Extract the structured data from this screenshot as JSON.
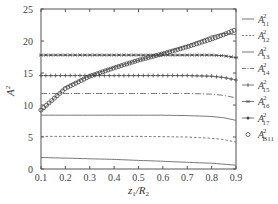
{
  "chart_data": {
    "type": "line",
    "title": "",
    "xlabel": "z1/R2",
    "ylabel": "A^2",
    "xlim": [
      0.1,
      0.9
    ],
    "ylim": [
      0,
      25
    ],
    "xticks": [
      0.1,
      0.2,
      0.3,
      0.4,
      0.5,
      0.6,
      0.7,
      0.8,
      0.9
    ],
    "yticks": [
      0,
      5,
      10,
      15,
      20,
      25
    ],
    "grid": false,
    "legend_position": "right-outside",
    "x": [
      0.1,
      0.2,
      0.3,
      0.4,
      0.5,
      0.6,
      0.7,
      0.8,
      0.85,
      0.9
    ],
    "series": [
      {
        "name": "A^2_11",
        "style": "solid",
        "values": [
          1.8,
          1.7,
          1.6,
          1.5,
          1.35,
          1.2,
          1.05,
          0.9,
          0.75,
          0.6
        ]
      },
      {
        "name": "A^2_12",
        "style": "dashed",
        "values": [
          5.1,
          5.1,
          5.1,
          5.1,
          5.1,
          5.05,
          5.0,
          4.8,
          4.6,
          4.2
        ]
      },
      {
        "name": "A^2_13",
        "style": "solid",
        "values": [
          8.4,
          8.4,
          8.4,
          8.4,
          8.4,
          8.4,
          8.35,
          8.2,
          8.0,
          7.6
        ]
      },
      {
        "name": "A^2_14",
        "style": "dash-dot",
        "values": [
          11.8,
          11.8,
          11.8,
          11.8,
          11.8,
          11.8,
          11.8,
          11.7,
          11.5,
          11.1
        ]
      },
      {
        "name": "A^2_15",
        "style": "plus-marker",
        "values": [
          14.6,
          14.6,
          14.6,
          14.6,
          14.6,
          14.6,
          14.6,
          14.5,
          14.3,
          13.9
        ]
      },
      {
        "name": "A^2_16",
        "style": "star-marker",
        "values": [
          17.8,
          17.8,
          17.8,
          17.8,
          17.8,
          17.8,
          17.8,
          17.8,
          17.7,
          17.4
        ]
      },
      {
        "name": "A^2_17",
        "style": "solid-dot-marker",
        "values": [
          9.0,
          12.8,
          14.6,
          15.9,
          17.0,
          18.1,
          19.3,
          20.8,
          21.2,
          21.0
        ]
      },
      {
        "name": "A^2_B11",
        "style": "circle-marker",
        "values": [
          9.2,
          12.6,
          14.5,
          15.8,
          17.0,
          18.0,
          19.1,
          20.3,
          21.0,
          21.8
        ]
      }
    ]
  },
  "axes": {
    "xlabel_main": "z",
    "xlabel_sub1": "1",
    "xlabel_slash": "/R",
    "xlabel_sub2": "2",
    "ylabel_main": "A",
    "ylabel_sup": "2"
  },
  "legend": [
    {
      "base": "A",
      "sup": "2",
      "sub": "11"
    },
    {
      "base": "A",
      "sup": "2",
      "sub": "12"
    },
    {
      "base": "A",
      "sup": "2",
      "sub": "13"
    },
    {
      "base": "A",
      "sup": "2",
      "sub": "14"
    },
    {
      "base": "A",
      "sup": "2",
      "sub": "15"
    },
    {
      "base": "A",
      "sup": "2",
      "sub": "16"
    },
    {
      "base": "A",
      "sup": "2",
      "sub": "17"
    },
    {
      "base": "A",
      "sup": "2",
      "sub": "B11"
    }
  ],
  "colors": {
    "axis": "#555555",
    "line": "#666666",
    "marker": "#444444"
  }
}
